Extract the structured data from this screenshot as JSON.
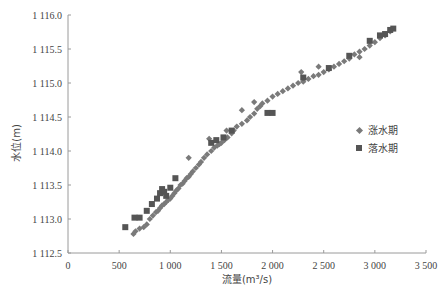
{
  "chart_data": {
    "type": "scatter",
    "title": "",
    "xlabel": "流量(m³/s)",
    "ylabel": "水位(m)",
    "xlim": [
      0,
      3500
    ],
    "ylim": [
      1112.5,
      1116.0
    ],
    "x_ticks": [
      0,
      500,
      1000,
      1500,
      2000,
      2500,
      3000,
      3500
    ],
    "x_tick_labels": [
      "0",
      "500",
      "1 000",
      "1 500",
      "2 000",
      "2 500",
      "3 000",
      "3 500"
    ],
    "y_ticks": [
      1112.5,
      1113.0,
      1113.5,
      1114.0,
      1114.5,
      1115.0,
      1115.5,
      1116.0
    ],
    "y_tick_labels": [
      "1 112.5",
      "1 113.0",
      "1 113.5",
      "1 114.0",
      "1 114.5",
      "1 115.0",
      "1 115.5",
      "1 116.0"
    ],
    "grid": false,
    "legend_position": "right-middle",
    "series": [
      {
        "name": "涨水期",
        "marker": "diamond",
        "color": "#7a7a7a",
        "points": [
          [
            640,
            1112.78
          ],
          [
            660,
            1112.82
          ],
          [
            700,
            1112.86
          ],
          [
            740,
            1112.88
          ],
          [
            770,
            1112.92
          ],
          [
            800,
            1113.0
          ],
          [
            830,
            1113.05
          ],
          [
            860,
            1113.1
          ],
          [
            880,
            1113.12
          ],
          [
            900,
            1113.16
          ],
          [
            920,
            1113.2
          ],
          [
            940,
            1113.22
          ],
          [
            960,
            1113.25
          ],
          [
            980,
            1113.28
          ],
          [
            1000,
            1113.3
          ],
          [
            1020,
            1113.34
          ],
          [
            1040,
            1113.38
          ],
          [
            1060,
            1113.42
          ],
          [
            1080,
            1113.45
          ],
          [
            1100,
            1113.5
          ],
          [
            1120,
            1113.52
          ],
          [
            1140,
            1113.56
          ],
          [
            1160,
            1113.6
          ],
          [
            1180,
            1113.62
          ],
          [
            1200,
            1113.66
          ],
          [
            1220,
            1113.7
          ],
          [
            1250,
            1113.75
          ],
          [
            1280,
            1113.8
          ],
          [
            1300,
            1113.84
          ],
          [
            1330,
            1113.9
          ],
          [
            1360,
            1113.95
          ],
          [
            1400,
            1114.0
          ],
          [
            1430,
            1114.05
          ],
          [
            1460,
            1114.08
          ],
          [
            1480,
            1114.1
          ],
          [
            1500,
            1114.12
          ],
          [
            1530,
            1114.16
          ],
          [
            1560,
            1114.2
          ],
          [
            1600,
            1114.26
          ],
          [
            1620,
            1114.3
          ],
          [
            1650,
            1114.36
          ],
          [
            1700,
            1114.4
          ],
          [
            1750,
            1114.45
          ],
          [
            1780,
            1114.5
          ],
          [
            1820,
            1114.55
          ],
          [
            1850,
            1114.62
          ],
          [
            1880,
            1114.66
          ],
          [
            1900,
            1114.7
          ],
          [
            1950,
            1114.74
          ],
          [
            2000,
            1114.8
          ],
          [
            2050,
            1114.84
          ],
          [
            2100,
            1114.88
          ],
          [
            2150,
            1114.92
          ],
          [
            2200,
            1114.96
          ],
          [
            2250,
            1115.0
          ],
          [
            2300,
            1115.02
          ],
          [
            2350,
            1115.06
          ],
          [
            2400,
            1115.1
          ],
          [
            2450,
            1115.12
          ],
          [
            2500,
            1115.16
          ],
          [
            2550,
            1115.2
          ],
          [
            2600,
            1115.24
          ],
          [
            2650,
            1115.28
          ],
          [
            2700,
            1115.32
          ],
          [
            2750,
            1115.36
          ],
          [
            2800,
            1115.42
          ],
          [
            2850,
            1115.46
          ],
          [
            2900,
            1115.5
          ],
          [
            2950,
            1115.55
          ],
          [
            3000,
            1115.6
          ],
          [
            3050,
            1115.66
          ],
          [
            3100,
            1115.7
          ],
          [
            3150,
            1115.76
          ],
          [
            1380,
            1114.18
          ],
          [
            1550,
            1114.3
          ],
          [
            1180,
            1113.9
          ],
          [
            2280,
            1115.16
          ],
          [
            2450,
            1115.24
          ],
          [
            1700,
            1114.6
          ],
          [
            1820,
            1114.72
          ],
          [
            2850,
            1115.38
          ]
        ]
      },
      {
        "name": "落水期",
        "marker": "square",
        "color": "#555555",
        "points": [
          [
            560,
            1112.88
          ],
          [
            650,
            1113.02
          ],
          [
            700,
            1113.02
          ],
          [
            770,
            1113.12
          ],
          [
            820,
            1113.22
          ],
          [
            870,
            1113.3
          ],
          [
            900,
            1113.38
          ],
          [
            920,
            1113.44
          ],
          [
            940,
            1113.4
          ],
          [
            960,
            1113.34
          ],
          [
            1000,
            1113.46
          ],
          [
            1050,
            1113.6
          ],
          [
            1400,
            1114.12
          ],
          [
            1450,
            1114.16
          ],
          [
            1520,
            1114.2
          ],
          [
            1600,
            1114.3
          ],
          [
            1950,
            1114.56
          ],
          [
            2000,
            1114.56
          ],
          [
            2300,
            1115.08
          ],
          [
            2550,
            1115.22
          ],
          [
            2750,
            1115.4
          ],
          [
            2950,
            1115.62
          ],
          [
            3050,
            1115.7
          ],
          [
            3100,
            1115.72
          ],
          [
            3150,
            1115.78
          ],
          [
            3180,
            1115.8
          ]
        ]
      }
    ]
  },
  "legend": {
    "items": [
      {
        "label": "涨水期",
        "marker": "diamond"
      },
      {
        "label": "落水期",
        "marker": "square"
      }
    ]
  },
  "axes": {
    "x_title": "流量(m³/s)",
    "y_title": "水位(m)"
  },
  "colors": {
    "axis": "#9a9a9a",
    "rising": "#7a7a7a",
    "falling": "#555555"
  }
}
